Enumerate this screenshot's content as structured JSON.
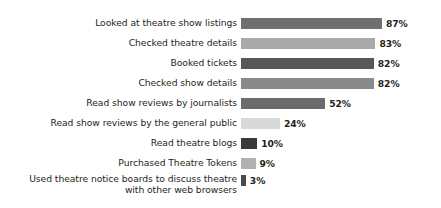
{
  "chart_data": {
    "type": "bar",
    "orientation": "horizontal",
    "title": "",
    "subtitle": "",
    "xlabel": "",
    "ylabel": "",
    "xlim": [
      0,
      100
    ],
    "grid": false,
    "legend": false,
    "value_suffix": "%",
    "categories": [
      "Looked at theatre show listings",
      "Checked theatre details",
      "Booked tickets",
      "Checked show details",
      "Read show reviews by journalists",
      "Read show reviews by the general public",
      "Read theatre blogs",
      "Purchased Theatre Tokens",
      "Used theatre notice boards to discuss theatre\nwith other web browsers"
    ],
    "values": [
      87,
      83,
      82,
      82,
      52,
      24,
      10,
      9,
      3
    ],
    "value_labels": [
      "87%",
      "83%",
      "82%",
      "82%",
      "52%",
      "24%",
      "10%",
      "9%",
      "3%"
    ],
    "bar_colors": [
      "#6f6f6f",
      "#a9a9a9",
      "#575757",
      "#8a8a8a",
      "#6b6b6b",
      "#d9d9d9",
      "#3a3a3a",
      "#b0b0b0",
      "#4a4a4a"
    ],
    "background_color": "#ffffff",
    "text_color": "#231f20"
  }
}
